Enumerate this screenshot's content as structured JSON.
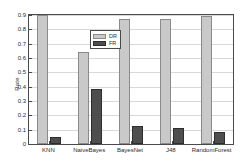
{
  "chart_data": {
    "type": "bar",
    "title": "",
    "xlabel": "",
    "ylabel": "Rate",
    "ylim": [
      0,
      0.9
    ],
    "grid": true,
    "legend_position": "top-left-inside",
    "categories": [
      "KNN",
      "NaiveBayes",
      "BayesNet",
      "J48",
      "RandomForest"
    ],
    "yticks": [
      0,
      0.1,
      0.2,
      0.3,
      0.4,
      0.5,
      0.6,
      0.7,
      0.8,
      0.9
    ],
    "ytick_labels": [
      "0",
      "0.1",
      "0.2",
      "0.3",
      "0.4",
      "0.5",
      "0.6",
      "0.7",
      "0.8",
      "0.9"
    ],
    "series": [
      {
        "name": "DR",
        "color": "#c9c9c9",
        "edge_color": "#8a8a8a",
        "values": [
          0.9,
          0.645,
          0.87,
          0.87,
          0.895
        ]
      },
      {
        "name": "FR",
        "color": "#4e4e4e",
        "edge_color": "#2e2e2e",
        "values": [
          0.048,
          0.385,
          0.125,
          0.11,
          0.082
        ]
      }
    ]
  },
  "legend": {
    "entries": [
      {
        "label": "DR"
      },
      {
        "label": "FR"
      }
    ]
  },
  "colors": {
    "dr": "#c9c9c9",
    "fr": "#4e4e4e",
    "axis": "#4a4a4a",
    "grid": "#d8d8d8",
    "background": "#ffffff"
  }
}
